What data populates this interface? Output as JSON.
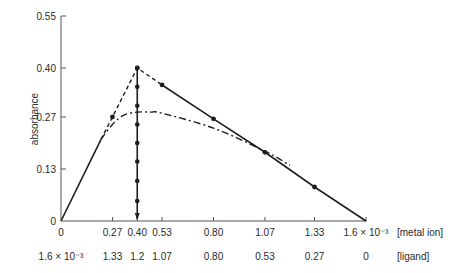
{
  "chart_data": {
    "type": "line",
    "title": "",
    "xlabel": "[metal ion]",
    "xlabel2": "[ligand]",
    "ylabel": "absorbance",
    "xlim": [
      0,
      0.0016
    ],
    "ylim": [
      0,
      0.55
    ],
    "grid": false,
    "legend": null,
    "x_ticks": {
      "values": [
        0,
        0.27,
        0.4,
        0.53,
        0.8,
        1.07,
        1.33,
        1.6
      ],
      "metal_ion_labels": [
        "0",
        "0.27",
        "0.40",
        "0.53",
        "0.80",
        "1.07",
        "1.33",
        "1.6 × 10⁻³"
      ],
      "ligand_labels": [
        "1.6 × 10⁻³",
        "1.33",
        "1.2",
        "1.07",
        "0.80",
        "0.53",
        "0.27",
        "0"
      ]
    },
    "y_ticks": {
      "values": [
        0,
        0.13,
        0.27,
        0.4,
        0.55
      ],
      "labels": [
        "0",
        "0.13",
        "0.27",
        "0.40",
        "0.55"
      ]
    },
    "x_units_note": "x values in units of 10⁻³",
    "series": [
      {
        "name": "ideal (extrapolated) solid lines",
        "style": "solid",
        "x": [
          0,
          0.21,
          0.4,
          0.53,
          0.8,
          1.07,
          1.33,
          1.6
        ],
        "y": [
          0,
          0.21,
          0.4,
          0.355,
          0.265,
          0.175,
          0.085,
          0
        ]
      },
      {
        "name": "extrapolation to maximum",
        "style": "dashed",
        "x": [
          0.21,
          0.27,
          0.4,
          0.53
        ],
        "y": [
          0.21,
          0.27,
          0.4,
          0.355
        ]
      },
      {
        "name": "measured curve",
        "style": "dash-dot",
        "x": [
          0.21,
          0.27,
          0.33,
          0.4,
          0.47,
          0.53,
          0.8,
          1.07,
          1.2
        ],
        "y": [
          0.21,
          0.25,
          0.275,
          0.283,
          0.283,
          0.28,
          0.24,
          0.178,
          0.14
        ]
      },
      {
        "name": "stoichiometry marker (vertical)",
        "style": "solid-arrow",
        "x": [
          0.4,
          0.4
        ],
        "y": [
          0.4,
          0.0
        ],
        "markers_y": [
          0.4,
          0.35,
          0.3,
          0.25,
          0.2,
          0.15,
          0.1,
          0.05
        ]
      }
    ],
    "marked_points": [
      {
        "x": 0.27,
        "y": 0.27
      },
      {
        "x": 0.4,
        "y": 0.4
      },
      {
        "x": 0.53,
        "y": 0.355
      },
      {
        "x": 0.8,
        "y": 0.265
      },
      {
        "x": 1.07,
        "y": 0.175
      },
      {
        "x": 1.33,
        "y": 0.085
      }
    ]
  },
  "colors": {
    "line": "#1e1e1e",
    "axis": "#555555",
    "text": "#2a2a2a"
  }
}
